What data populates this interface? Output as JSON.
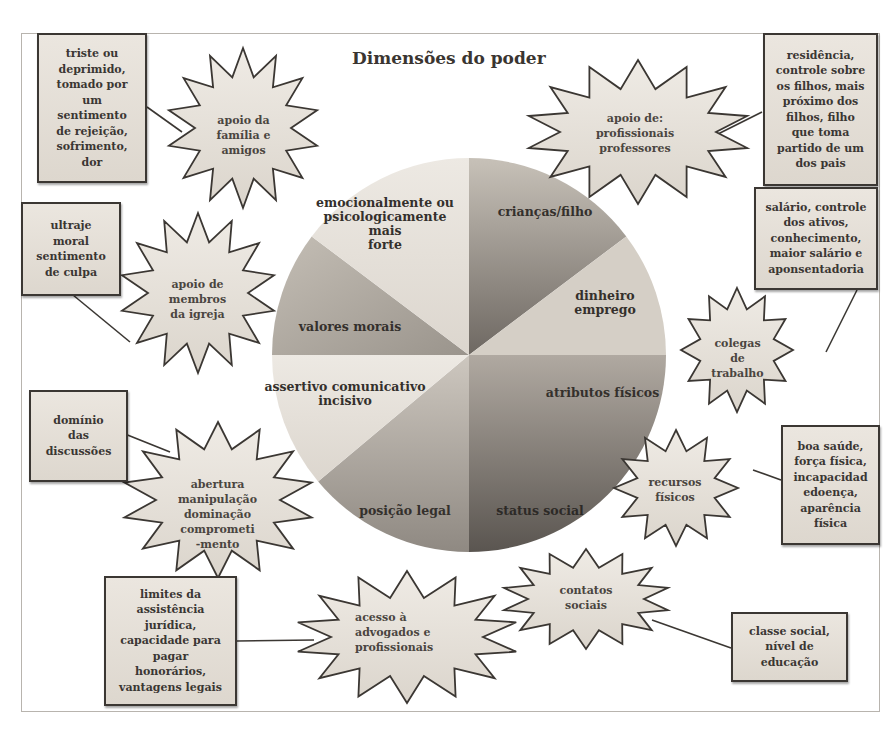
{
  "title": "Dimensões do poder",
  "pie": {
    "slices": [
      {
        "label": "crianças/filho",
        "shade": "dark-gradient"
      },
      {
        "label": "dinheiro\nemprego",
        "shade": "light"
      },
      {
        "label": "atributos físicos",
        "shade": "mid-gradient"
      },
      {
        "label": "status social",
        "shade": "dark-gradient"
      },
      {
        "label": "posição legal",
        "shade": "mid"
      },
      {
        "label": "assertivo comunicativo\nincisivo",
        "shade": "light"
      },
      {
        "label": "valores morais",
        "shade": "mid"
      },
      {
        "label": "emocionalmente ou\npsicologicamente mais\nforte",
        "shade": "light"
      }
    ]
  },
  "bursts": [
    {
      "id": "familia",
      "label": "apoio  da\nfamília e\namigos"
    },
    {
      "id": "profissionais",
      "label": "apoio de:\nprofissionais\nprofessores"
    },
    {
      "id": "igreja",
      "label": "apoio  de\nmembros\nda igreja"
    },
    {
      "id": "colegas",
      "label": "colegas\nde\ntrabalho"
    },
    {
      "id": "abertura",
      "label": "abertura\nmanipulação\ndominação\ncomprometi\n-mento"
    },
    {
      "id": "recursos",
      "label": "recursos\nfísicos"
    },
    {
      "id": "acesso",
      "label": "acesso à\nadvogados  e\nprofissionais"
    },
    {
      "id": "contatos",
      "label": "contatos\nsociais"
    }
  ],
  "boxes": [
    {
      "id": "triste",
      "label": "triste ou\ndeprimido,\ntomado por\num\nsentimento\nde rejeição,\nsofrimento,\ndor"
    },
    {
      "id": "residencia",
      "label": "residência,\ncontrole sobre\nos filhos, mais\npróximo dos\nfilhos, filho\nque toma\npartido de um\ndos pais"
    },
    {
      "id": "ultraje",
      "label": "ultraje\nmoral\nsentimento\nde culpa"
    },
    {
      "id": "salario",
      "label": "salário,  controle\ndos ativos,\nconhecimento,\nmaior salário e\naponsentadoria"
    },
    {
      "id": "dominio",
      "label": "domínio\ndas\ndiscussões"
    },
    {
      "id": "saude",
      "label": "boa saúde,\nforça física,\nincapacidad\nedoença,\naparência\nfísica"
    },
    {
      "id": "limites",
      "label": "limites da\nassistência\njurídica,\ncapacidade para\npagar\nhonorários,\nvantagens  legais"
    },
    {
      "id": "classe",
      "label": "classe social,\nnível de\neducação"
    }
  ]
}
